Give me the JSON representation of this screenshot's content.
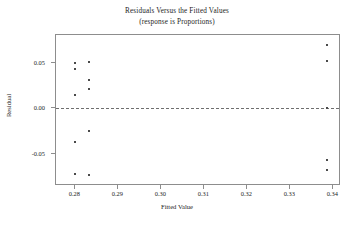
{
  "chart_data": {
    "type": "scatter",
    "title": "Residuals Versus the Fitted Values",
    "subtitle": "(response is Proportions)",
    "xlabel": "Fitted Value",
    "ylabel": "Residual",
    "xlim": [
      0.2755,
      0.3418
    ],
    "ylim": [
      -0.0855,
      0.0805
    ],
    "xticks": [
      0.28,
      0.29,
      0.3,
      0.31,
      0.32,
      0.33,
      0.34
    ],
    "xticklabels": [
      "0.28",
      "0.29",
      "0.30",
      "0.31",
      "0.32",
      "0.33",
      "0.34"
    ],
    "yticks": [
      0.05,
      0.0,
      -0.05
    ],
    "yticklabels": [
      "0.05",
      "0.00",
      "-0.05"
    ],
    "grid": false,
    "legend": null,
    "reference_line": {
      "orientation": "horizontal",
      "y": 0.0,
      "style": "dashed"
    },
    "marker": {
      "shape": "square",
      "size": 2,
      "color": "#4a4a4a"
    },
    "points": [
      {
        "x": 0.28,
        "y": 0.05
      },
      {
        "x": 0.2832,
        "y": 0.0512
      },
      {
        "x": 0.28,
        "y": 0.043
      },
      {
        "x": 0.2832,
        "y": 0.031
      },
      {
        "x": 0.2832,
        "y": 0.0215
      },
      {
        "x": 0.28,
        "y": 0.014
      },
      {
        "x": 0.2832,
        "y": -0.025
      },
      {
        "x": 0.28,
        "y": -0.037
      },
      {
        "x": 0.28,
        "y": -0.072
      },
      {
        "x": 0.2832,
        "y": -0.0735
      },
      {
        "x": 0.3385,
        "y": 0.069
      },
      {
        "x": 0.3385,
        "y": 0.052
      },
      {
        "x": 0.3385,
        "y": 0.0005
      },
      {
        "x": 0.3385,
        "y": -0.057
      },
      {
        "x": 0.3385,
        "y": -0.068
      }
    ],
    "n_points": 15,
    "colors": {
      "axis": "#8d8d8d",
      "text": "#1c1c1c",
      "marker": "#4a4a4a",
      "refline": "#6e6e6e",
      "background": "#ffffff"
    }
  }
}
